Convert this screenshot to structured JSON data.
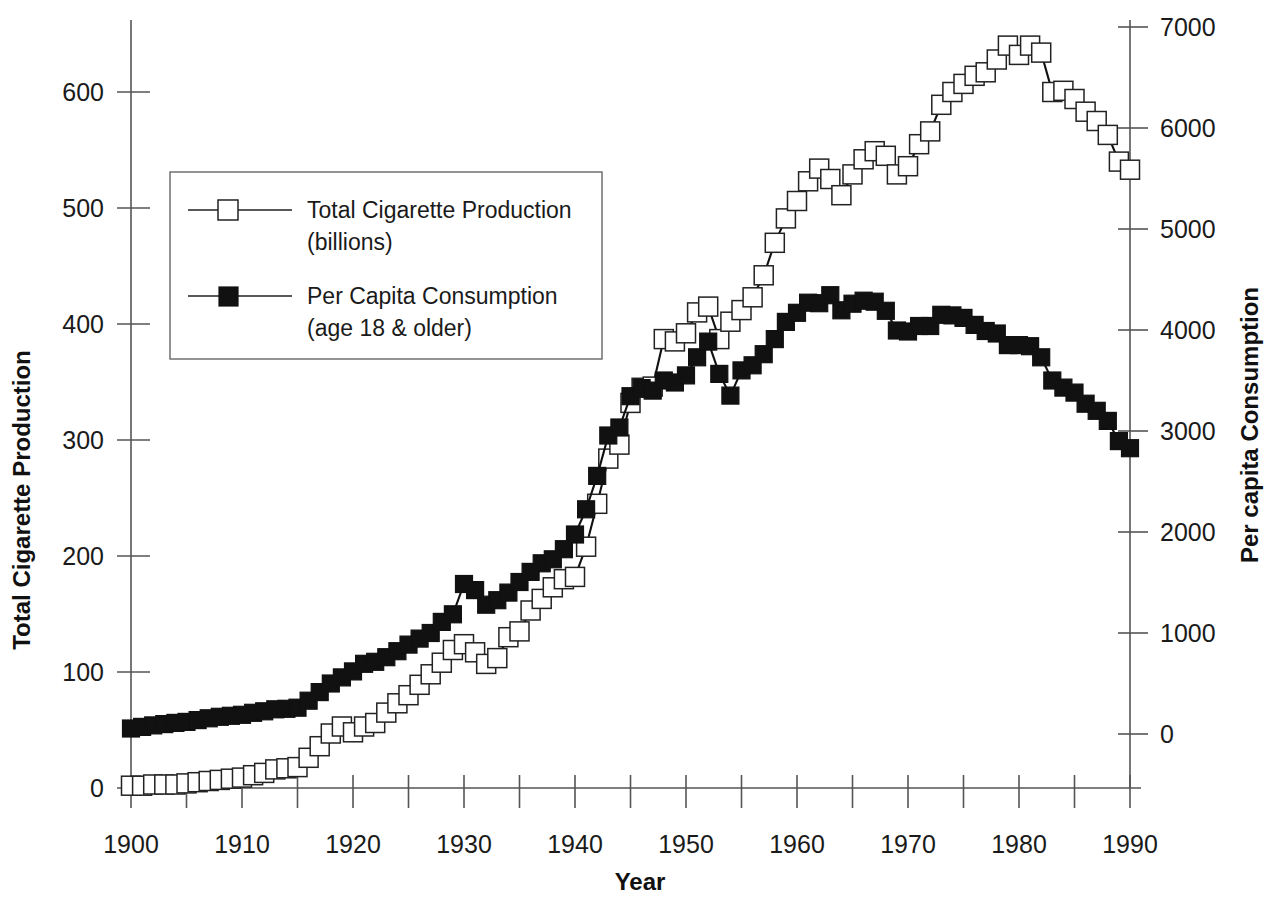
{
  "chart_data": {
    "type": "line",
    "title": "",
    "xlabel": "Year",
    "ylabel": "Total Cigarette Production",
    "y2label": "Per capita Consumption",
    "xlim": [
      1900,
      1990
    ],
    "ylim": [
      0,
      700
    ],
    "y2lim": [
      0,
      7000
    ],
    "grid": false,
    "legend_position": "upper-left",
    "xticks": [
      1900,
      1910,
      1920,
      1930,
      1940,
      1950,
      1960,
      1970,
      1980,
      1990
    ],
    "xtick_labels": [
      "1900",
      "1910",
      "1920",
      "1930",
      "1940",
      "1950",
      "1960",
      "1970",
      "1980",
      "1990"
    ],
    "xminor_step": 5,
    "yticks": [
      0,
      100,
      200,
      300,
      400,
      500,
      600
    ],
    "ytick_labels": [
      "0",
      "100",
      "200",
      "300",
      "400",
      "500",
      "600"
    ],
    "y2ticks": [
      0,
      1000,
      2000,
      3000,
      4000,
      5000,
      6000,
      7000
    ],
    "y2tick_labels": [
      "0",
      "1000",
      "2000",
      "3000",
      "4000",
      "5000",
      "6000",
      "7000"
    ],
    "x": [
      1900,
      1901,
      1902,
      1903,
      1904,
      1905,
      1906,
      1907,
      1908,
      1909,
      1910,
      1911,
      1912,
      1913,
      1914,
      1915,
      1916,
      1917,
      1918,
      1919,
      1920,
      1921,
      1922,
      1923,
      1924,
      1925,
      1926,
      1927,
      1928,
      1929,
      1930,
      1931,
      1932,
      1933,
      1934,
      1935,
      1936,
      1937,
      1938,
      1939,
      1940,
      1941,
      1942,
      1943,
      1944,
      1945,
      1946,
      1947,
      1948,
      1949,
      1950,
      1951,
      1952,
      1953,
      1954,
      1955,
      1956,
      1957,
      1958,
      1959,
      1960,
      1961,
      1962,
      1963,
      1964,
      1965,
      1966,
      1967,
      1968,
      1969,
      1970,
      1971,
      1972,
      1973,
      1974,
      1975,
      1976,
      1977,
      1978,
      1979,
      1980,
      1981,
      1982,
      1983,
      1984,
      1985,
      1986,
      1987,
      1988,
      1989,
      1990
    ],
    "series": [
      {
        "name": "Total Cigarette Production (billions)",
        "axis": "left",
        "marker": "open-square",
        "units": "billions",
        "values": [
          2,
          2,
          3,
          3,
          3,
          4,
          5,
          6,
          7,
          8,
          9,
          11,
          13,
          16,
          17,
          18,
          26,
          36,
          47,
          53,
          48,
          53,
          56,
          65,
          73,
          80,
          89,
          98,
          108,
          119,
          124,
          117,
          107,
          112,
          130,
          135,
          153,
          163,
          173,
          180,
          182,
          208,
          245,
          284,
          296,
          332,
          345,
          346,
          387,
          385,
          392,
          410,
          415,
          387,
          402,
          412,
          423,
          442,
          470,
          491,
          506,
          523,
          534,
          525,
          511,
          529,
          542,
          549,
          545,
          529,
          536,
          555,
          566,
          589,
          600,
          607,
          614,
          617,
          628,
          640,
          632,
          640,
          634,
          600,
          601,
          594,
          583,
          575,
          563,
          540,
          533
        ]
      },
      {
        "name": "Per Capita Consumption (age 18 & older)",
        "axis": "right",
        "marker": "filled-square",
        "units": "cigarettes per capita",
        "values": [
          54,
          70,
          85,
          98,
          110,
          120,
          138,
          155,
          170,
          180,
          190,
          210,
          225,
          245,
          250,
          260,
          330,
          415,
          500,
          560,
          620,
          695,
          715,
          760,
          820,
          885,
          945,
          1000,
          1110,
          1185,
          1485,
          1425,
          1280,
          1325,
          1400,
          1505,
          1605,
          1690,
          1730,
          1830,
          1975,
          2225,
          2555,
          2955,
          3035,
          3345,
          3425,
          3400,
          3500,
          3480,
          3550,
          3730,
          3885,
          3565,
          3350,
          3600,
          3650,
          3760,
          3910,
          4080,
          4170,
          4270,
          4265,
          4345,
          4195,
          4260,
          4290,
          4280,
          4190,
          3995,
          3985,
          4040,
          4040,
          4150,
          4145,
          4120,
          4050,
          3990,
          3965,
          3850,
          3850,
          3840,
          3730,
          3500,
          3430,
          3380,
          3270,
          3200,
          3100,
          2900,
          2830
        ]
      }
    ]
  },
  "legend": {
    "entries": [
      {
        "marker": "open-square",
        "line1": "Total Cigarette Production",
        "line2": "(billions)"
      },
      {
        "marker": "filled-square",
        "line1": "Per Capita Consumption",
        "line2": "(age 18 & older)"
      }
    ]
  },
  "axes": {
    "left_title": "Total Cigarette Production",
    "right_title": "Per capita Consumption",
    "bottom_title": "Year"
  },
  "colors": {
    "background": "#ffffff",
    "line": "#111111",
    "axis": "#555555",
    "text": "#1a1a1a",
    "marker_open_fill": "#ffffff",
    "marker_filled_fill": "#111111"
  }
}
